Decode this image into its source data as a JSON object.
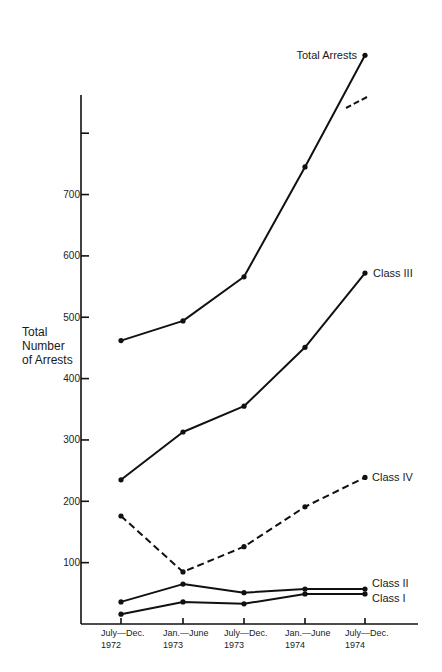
{
  "chart_data": {
    "type": "line",
    "title": "",
    "xlabel": "",
    "ylabel": "Total Number of Arrests",
    "ylabel_lines": [
      "Total",
      "Number",
      "of Arrests"
    ],
    "categories": [
      "July–Dec. 1972",
      "Jan.–June 1973",
      "July–Dec. 1973",
      "Jan.–June 1974",
      "July–Dec. 1974"
    ],
    "x_tick_labels": [
      {
        "line1": "July—Dec.",
        "line2": "1972"
      },
      {
        "line1": "Jan.—June",
        "line2": "1973"
      },
      {
        "line1": "July—Dec.",
        "line2": "1973"
      },
      {
        "line1": "Jan.—June",
        "line2": "1974"
      },
      {
        "line1": "July—Dec.",
        "line2": "1974"
      }
    ],
    "y_ticks": [
      100,
      200,
      300,
      400,
      500,
      600,
      700,
      800
    ],
    "y_tick_labels": [
      "100",
      "200",
      "300",
      "400",
      "500",
      "600",
      "700",
      ""
    ],
    "ylim": [
      0,
      860
    ],
    "grid": false,
    "legend": "inline labels at series ends",
    "series": [
      {
        "name": "Total Arrests",
        "style": "solid",
        "values": [
          462,
          494,
          566,
          745,
          927
        ]
      },
      {
        "name": "Class III",
        "style": "solid",
        "values": [
          235,
          313,
          355,
          451,
          572
        ]
      },
      {
        "name": "Class IV",
        "style": "dashed",
        "values": [
          176,
          85,
          126,
          191,
          239
        ]
      },
      {
        "name": "Class II",
        "style": "solid",
        "values": [
          36,
          65,
          51,
          57,
          57
        ]
      },
      {
        "name": "Class I",
        "style": "solid",
        "values": [
          16,
          36,
          33,
          49,
          49
        ]
      }
    ],
    "annotations": [
      {
        "type": "dashed-pointer",
        "target": "Total Arrests",
        "near_value": 870
      }
    ]
  }
}
